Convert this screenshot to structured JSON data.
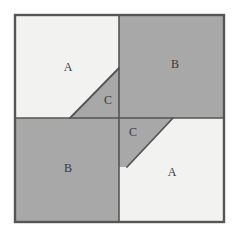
{
  "figure": {
    "background_color": "#ffffff",
    "light_fill": "#f2f2f0",
    "dark_fill": "#a8a8a8",
    "line_color": "#555555",
    "label_color": "#3a3a3a",
    "outer_square": {
      "x": 15,
      "y": 15,
      "width": 209,
      "height": 207,
      "stroke_width": 2.4
    },
    "center": {
      "x": 119,
      "y": 118
    },
    "diagonals": [
      {
        "name": "top-left-diagonal",
        "x1": 70,
        "y1": 118,
        "x2": 119,
        "y2": 68
      },
      {
        "name": "bottom-right-diagonal",
        "x1": 127,
        "y1": 167,
        "x2": 173,
        "y2": 118
      }
    ],
    "regions": [
      {
        "id": "top-left-a",
        "label": "A",
        "shade": "light",
        "points": "15,15 119,15 119,68 70,118 15,118",
        "label_x": 68,
        "label_y": 68
      },
      {
        "id": "top-left-c",
        "label": "C",
        "shade": "dark",
        "points": "70,118 119,68 119,118",
        "label_x": 108,
        "label_y": 101
      },
      {
        "id": "top-right-b",
        "label": "B",
        "shade": "dark",
        "points": "119,15 224,15 224,118 119,118",
        "label_x": 175,
        "label_y": 65
      },
      {
        "id": "bottom-left-b",
        "label": "B",
        "shade": "dark",
        "points": "15,118 119,118 119,222 15,222",
        "label_x": 68,
        "label_y": 169
      },
      {
        "id": "bottom-right-c",
        "label": "C",
        "shade": "dark",
        "points": "119,118 173,118 127,167 119,167",
        "label_x": 133,
        "label_y": 133
      },
      {
        "id": "bottom-right-a",
        "label": "A",
        "shade": "light",
        "points": "173,118 224,118 224,222 119,222 119,167 127,167",
        "label_x": 172,
        "label_y": 173
      }
    ]
  }
}
